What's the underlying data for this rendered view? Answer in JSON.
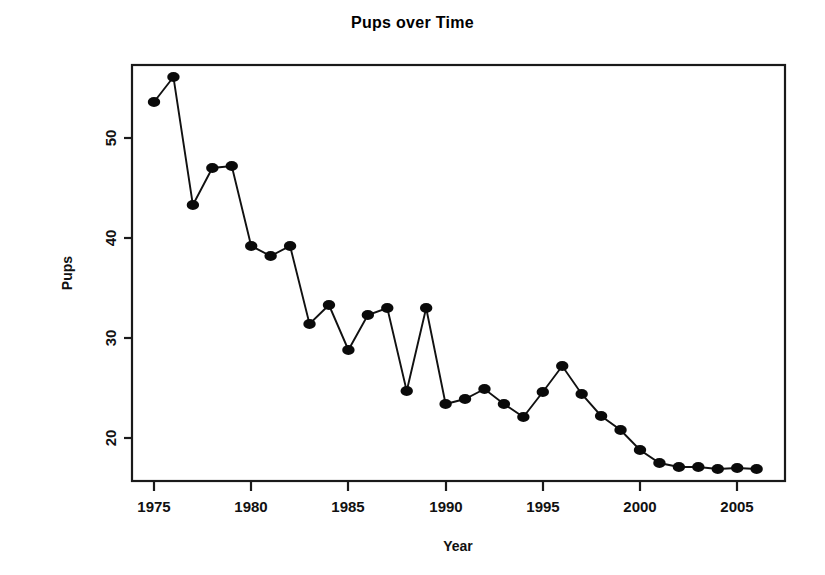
{
  "chart_data": {
    "type": "line",
    "title": "Pups over Time",
    "xlabel": "Year",
    "ylabel": "Pups",
    "xlim": [
      1974.2,
      2006.5
    ],
    "ylim": [
      16.1,
      57.3
    ],
    "grid": false,
    "legend": null,
    "marker": "filled-circle",
    "line_style": "solid-thin",
    "x_ticks": [
      1975,
      1980,
      1985,
      1990,
      1995,
      2000,
      2005
    ],
    "x_tick_labels": [
      "1975",
      "1980",
      "1985",
      "1990",
      "1995",
      "2000",
      "2005"
    ],
    "y_ticks": [
      20,
      30,
      40,
      50
    ],
    "y_tick_labels": [
      "20",
      "30",
      "40",
      "50"
    ],
    "series": [
      {
        "name": "Pups",
        "color": "#0a0a0a",
        "x": [
          1975,
          1976,
          1977,
          1978,
          1979,
          1980,
          1981,
          1982,
          1983,
          1984,
          1985,
          1986,
          1987,
          1988,
          1989,
          1990,
          1991,
          1992,
          1993,
          1994,
          1995,
          1996,
          1997,
          1998,
          1999,
          2000,
          2001,
          2002,
          2003,
          2004,
          2005,
          2006
        ],
        "values": [
          53.6,
          56.1,
          43.3,
          47.0,
          47.2,
          39.2,
          38.2,
          39.2,
          31.4,
          33.3,
          28.8,
          32.3,
          33.0,
          24.7,
          33.0,
          23.4,
          23.9,
          24.9,
          23.4,
          22.1,
          24.6,
          27.2,
          24.4,
          22.2,
          20.8,
          18.8,
          17.5,
          17.1,
          17.1,
          16.9,
          17.0,
          16.9
        ]
      }
    ]
  },
  "figure": {
    "title": "Pups over Time",
    "xlabel": "Year",
    "ylabel": "Pups"
  }
}
